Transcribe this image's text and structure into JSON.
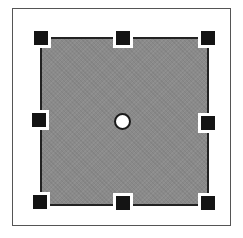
{
  "diagram": {
    "type": "selected-shape-with-resize-handles",
    "frame": {
      "border_color": "#555555",
      "background": "#ffffff"
    },
    "shape": {
      "kind": "rectangle",
      "fill_color": "#8a8a8a",
      "border_color": "#222222",
      "selected": true
    },
    "handles": [
      {
        "id": "top-left",
        "x": 34,
        "y": 31
      },
      {
        "id": "top-center",
        "x": 116,
        "y": 31
      },
      {
        "id": "top-right",
        "x": 201,
        "y": 31
      },
      {
        "id": "middle-left",
        "x": 32,
        "y": 113
      },
      {
        "id": "middle-right",
        "x": 201,
        "y": 116
      },
      {
        "id": "bottom-left",
        "x": 33,
        "y": 195
      },
      {
        "id": "bottom-center",
        "x": 116,
        "y": 196
      },
      {
        "id": "bottom-right",
        "x": 201,
        "y": 196
      }
    ],
    "handle_color": "#141414",
    "center_point": {
      "x": 114,
      "y": 113,
      "fill": "#ffffff",
      "stroke": "#1a1a1a"
    }
  }
}
